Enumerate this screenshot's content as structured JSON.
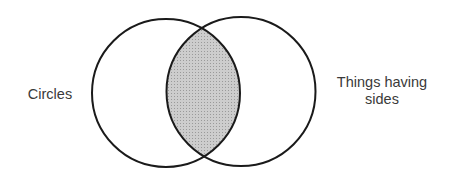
{
  "diagram": {
    "type": "venn",
    "sets": [
      {
        "id": "left",
        "label": "Circles",
        "cx": 166,
        "cy": 93,
        "r": 74
      },
      {
        "id": "right",
        "label": "Things having sides",
        "label_lines": [
          "Things having",
          "sides"
        ],
        "cx": 241,
        "cy": 91.5,
        "r": 74.5
      }
    ],
    "intersection": {
      "shaded": true,
      "fill": "#c4c4c4"
    },
    "colors": {
      "stroke": "#1a1a1a",
      "text": "#3a3a3a",
      "background": "#ffffff"
    }
  }
}
